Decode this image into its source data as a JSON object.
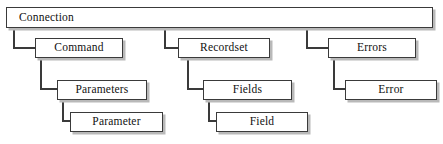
{
  "diagram": {
    "type": "hierarchy-tree",
    "root": {
      "label": "Connection"
    },
    "branches": [
      {
        "name": "command-branch",
        "nodes": [
          {
            "label": "Command"
          },
          {
            "label": "Parameters"
          },
          {
            "label": "Parameter"
          }
        ]
      },
      {
        "name": "recordset-branch",
        "nodes": [
          {
            "label": "Recordset"
          },
          {
            "label": "Fields"
          },
          {
            "label": "Field"
          }
        ]
      },
      {
        "name": "errors-branch",
        "nodes": [
          {
            "label": "Errors"
          },
          {
            "label": "Error"
          }
        ]
      }
    ],
    "colors": {
      "border": "#3a3a3a",
      "shadow": "#b9b9b9",
      "background": "#ffffff",
      "text": "#111111"
    }
  }
}
